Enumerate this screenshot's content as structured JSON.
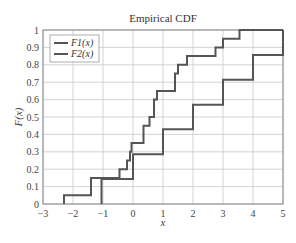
{
  "chart_data": {
    "type": "line",
    "subtype": "step",
    "title": "Empirical CDF",
    "xlabel": "x",
    "ylabel": "F(x)",
    "xlim": [
      -3,
      5
    ],
    "ylim": [
      0,
      1
    ],
    "xticks": [
      -3,
      -2,
      -1,
      0,
      1,
      2,
      3,
      4,
      5
    ],
    "xtick_labels": [
      "−3",
      "−2",
      "−1",
      "0",
      "1",
      "2",
      "3",
      "4",
      "5"
    ],
    "yticks": [
      0,
      0.1,
      0.2,
      0.3,
      0.4,
      0.5,
      0.6,
      0.7,
      0.8,
      0.9,
      1
    ],
    "ytick_labels": [
      "0",
      "0.1",
      "0.2",
      "0.3",
      "0.4",
      "0.5",
      "0.6",
      "0.7",
      "0.8",
      "0.9",
      "1"
    ],
    "grid": true,
    "legend_position": "upper left",
    "series": [
      {
        "name": "F1(x)",
        "color": "#555555",
        "x": [
          -2.3,
          -1.4,
          -0.45,
          -0.2,
          -0.1,
          -0.05,
          0.35,
          0.55,
          0.7,
          0.8,
          1.4,
          1.5,
          1.8,
          2.75,
          3.0,
          3.55
        ],
        "y": [
          0.05,
          0.15,
          0.2,
          0.25,
          0.3,
          0.35,
          0.45,
          0.5,
          0.6,
          0.65,
          0.75,
          0.8,
          0.85,
          0.9,
          0.95,
          1.0
        ]
      },
      {
        "name": "F2(x)",
        "color": "#555555",
        "x": [
          -1.05,
          0.0,
          1.0,
          2.0,
          3.0,
          4.0,
          5.0
        ],
        "y": [
          0.143,
          0.286,
          0.429,
          0.571,
          0.714,
          0.857,
          1.0
        ]
      }
    ]
  },
  "legend": {
    "items": [
      "F1(x)",
      "F2(x)"
    ]
  }
}
